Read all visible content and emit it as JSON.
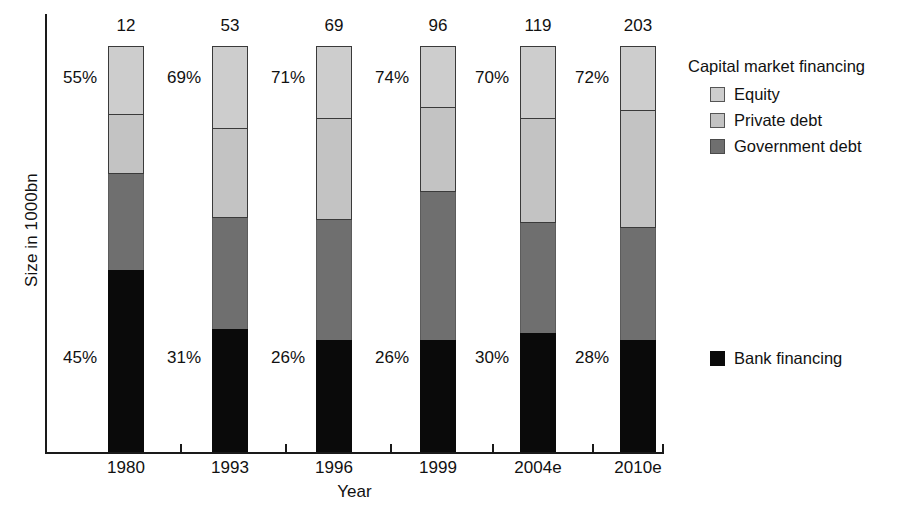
{
  "chart_data": {
    "type": "bar",
    "title": "",
    "xlabel": "Year",
    "ylabel": "Size in 1000bn",
    "categories": [
      "1980",
      "1993",
      "1996",
      "1999",
      "2004e",
      "2010e"
    ],
    "totals": [
      12,
      53,
      69,
      96,
      119,
      203
    ],
    "total_labels": [
      "12",
      "53",
      "69",
      "96",
      "119",
      "203"
    ],
    "capital_market_pct": [
      "55%",
      "69%",
      "71%",
      "74%",
      "70%",
      "72%"
    ],
    "bank_financing_pct": [
      "45%",
      "31%",
      "26%",
      "26%",
      "30%",
      "28%"
    ],
    "stacked": true,
    "grid": false,
    "legend_position": "right",
    "series": [
      {
        "name": "Equity",
        "color": "#cdcdcd",
        "values": [
          17.0,
          20.4,
          17.9,
          15.3,
          18.0,
          16.0
        ]
      },
      {
        "name": "Private debt",
        "color": "#c3c3c3",
        "values": [
          14.5,
          21.9,
          24.9,
          20.7,
          25.6,
          28.8
        ]
      },
      {
        "name": "Government debt",
        "color": "#6f6f6f",
        "values": [
          23.6,
          27.3,
          29.6,
          36.5,
          27.1,
          27.6
        ]
      },
      {
        "name": "Bank financing",
        "color": "#0a0a0a",
        "values": [
          44.8,
          30.3,
          27.6,
          27.6,
          29.3,
          27.6
        ]
      }
    ],
    "segment_pixels": [
      {
        "category": "1980",
        "left": 108,
        "equity_top": 46,
        "private_top": 115,
        "government_top": 174,
        "bank_top": 270,
        "baseline": 452
      },
      {
        "category": "1993",
        "left": 212,
        "equity_top": 46,
        "private_top": 129,
        "government_top": 218,
        "bank_top": 329,
        "baseline": 452
      },
      {
        "category": "1996",
        "left": 316,
        "equity_top": 46,
        "private_top": 119,
        "government_top": 220,
        "bank_top": 340,
        "baseline": 452
      },
      {
        "category": "1999",
        "left": 420,
        "equity_top": 46,
        "private_top": 108,
        "government_top": 192,
        "bank_top": 340,
        "baseline": 452
      },
      {
        "category": "2004e",
        "left": 520,
        "equity_top": 46,
        "private_top": 119,
        "government_top": 223,
        "bank_top": 333,
        "baseline": 452
      },
      {
        "category": "2010e",
        "left": 620,
        "equity_top": 46,
        "private_top": 111,
        "government_top": 228,
        "bank_top": 340,
        "baseline": 452
      }
    ]
  },
  "legend": {
    "capital_title": "Capital market financing",
    "items": [
      {
        "label": "Equity",
        "swatch": "sw-equity"
      },
      {
        "label": "Private debt",
        "swatch": "sw-private"
      },
      {
        "label": "Government debt",
        "swatch": "sw-government"
      }
    ],
    "bank": {
      "label": "Bank financing",
      "swatch": "sw-bank"
    }
  },
  "axes": {
    "x_title": "Year",
    "y_title": "Size in 1000bn"
  }
}
